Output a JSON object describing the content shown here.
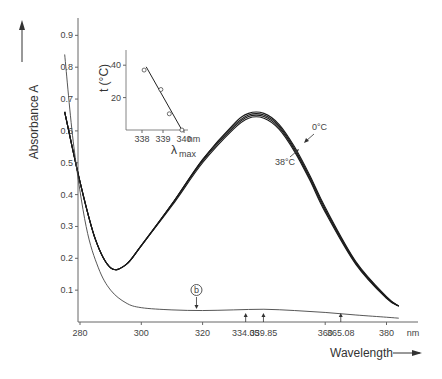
{
  "chart_data": {
    "type": "line",
    "title": "",
    "xlabel": "Wavelength",
    "ylabel": "Absorbance A",
    "x_unit": "nm",
    "xlim": [
      275,
      385
    ],
    "ylim": [
      0.0,
      0.95
    ],
    "x_ticks": [
      "280",
      "300",
      "320",
      "360",
      "380"
    ],
    "y_ticks": [
      "0.1",
      "0.2",
      "0.3",
      "0.4",
      "0.5",
      "0.6",
      "0.7",
      "0.8",
      "0.9"
    ],
    "grid": false,
    "legend": null,
    "series": [
      {
        "name": "0°C",
        "x": [
          275,
          280,
          285,
          290,
          295,
          300,
          310,
          320,
          330,
          335,
          340,
          345,
          350,
          355,
          360,
          370,
          380,
          384
        ],
        "values": [
          0.66,
          0.44,
          0.26,
          0.17,
          0.18,
          0.24,
          0.37,
          0.51,
          0.62,
          0.655,
          0.655,
          0.62,
          0.55,
          0.46,
          0.36,
          0.19,
          0.08,
          0.05
        ]
      },
      {
        "name": "10°C",
        "x": [
          275,
          280,
          285,
          290,
          295,
          300,
          310,
          320,
          330,
          335,
          340,
          345,
          350,
          355,
          360,
          370,
          380,
          384
        ],
        "values": [
          0.66,
          0.44,
          0.26,
          0.17,
          0.18,
          0.24,
          0.37,
          0.51,
          0.615,
          0.65,
          0.65,
          0.615,
          0.545,
          0.455,
          0.355,
          0.187,
          0.078,
          0.05
        ]
      },
      {
        "name": "25°C",
        "x": [
          275,
          280,
          285,
          290,
          295,
          300,
          310,
          320,
          330,
          335,
          340,
          345,
          350,
          355,
          360,
          370,
          380,
          384
        ],
        "values": [
          0.66,
          0.44,
          0.26,
          0.17,
          0.18,
          0.24,
          0.37,
          0.505,
          0.61,
          0.645,
          0.645,
          0.61,
          0.54,
          0.45,
          0.35,
          0.184,
          0.076,
          0.05
        ]
      },
      {
        "name": "38°C",
        "x": [
          275,
          280,
          285,
          290,
          295,
          300,
          310,
          320,
          330,
          335,
          340,
          345,
          350,
          355,
          360,
          370,
          380,
          384
        ],
        "values": [
          0.66,
          0.44,
          0.26,
          0.17,
          0.18,
          0.24,
          0.365,
          0.5,
          0.605,
          0.64,
          0.64,
          0.605,
          0.535,
          0.445,
          0.345,
          0.181,
          0.074,
          0.05
        ]
      },
      {
        "name": "b",
        "x": [
          275,
          278,
          282,
          286,
          290,
          295,
          300,
          310,
          320,
          330,
          340,
          350,
          360,
          370,
          380,
          384
        ],
        "values": [
          0.84,
          0.55,
          0.3,
          0.17,
          0.1,
          0.06,
          0.045,
          0.038,
          0.036,
          0.038,
          0.04,
          0.036,
          0.03,
          0.022,
          0.015,
          0.012
        ]
      }
    ],
    "annotations": [
      {
        "text": "0°C",
        "near": "upper curve right flank"
      },
      {
        "text": "38°C",
        "near": "lower curve right flank"
      },
      {
        "text": "b",
        "marker": "circled",
        "x": 318,
        "arrow": "down"
      },
      {
        "text": "334.05",
        "x": 334.05,
        "arrow": "up"
      },
      {
        "text": "339.85",
        "x": 339.85,
        "arrow": "up"
      },
      {
        "text": "365.08",
        "x": 365.08,
        "arrow": "up"
      }
    ],
    "inset": {
      "type": "scatter",
      "xlabel": "λmax",
      "ylabel": "t (°C)",
      "x_unit": "nm",
      "x_ticks": [
        "338",
        "339",
        "340"
      ],
      "y_ticks": [
        "20",
        "40"
      ],
      "points": [
        {
          "x": 338.1,
          "y": 37
        },
        {
          "x": 338.9,
          "y": 25
        },
        {
          "x": 339.3,
          "y": 10
        },
        {
          "x": 339.9,
          "y": 0
        }
      ],
      "fit_line": [
        {
          "x": 338.2,
          "y": 39
        },
        {
          "x": 339.9,
          "y": 0
        }
      ]
    }
  },
  "labels": {
    "y_axis_title": "Absorbance A",
    "x_axis_title": "Wavelength",
    "x_unit": "nm",
    "curve_label_top": "0°C",
    "curve_label_bottom": "38°C",
    "marker_b": "b",
    "peak_marks": [
      "334.05",
      "339.85",
      "365.08"
    ],
    "inset_y_title": "t (°C)",
    "inset_x_title": "λ",
    "inset_x_sub": "max",
    "inset_x_unit": "nm"
  }
}
